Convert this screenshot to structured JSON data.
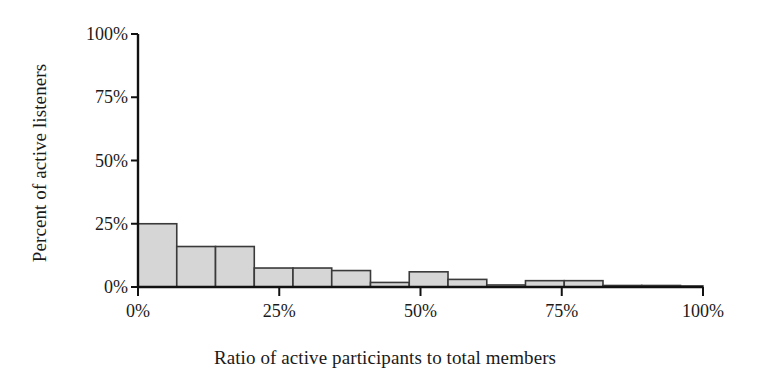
{
  "chart_data": {
    "type": "bar",
    "title": "",
    "subtitle": "",
    "xlabel": "Ratio of active participants to total members",
    "ylabel": "Percent of active listeners",
    "xlim": [
      0,
      100
    ],
    "ylim": [
      0,
      100
    ],
    "grid": false,
    "legend": null,
    "x_ticks": [
      {
        "value": 0,
        "label": "0%"
      },
      {
        "value": 25,
        "label": "25%"
      },
      {
        "value": 50,
        "label": "50%"
      },
      {
        "value": 75,
        "label": "75%"
      },
      {
        "value": 100,
        "label": "100%"
      }
    ],
    "y_ticks": [
      {
        "value": 0,
        "label": "0%"
      },
      {
        "value": 25,
        "label": "25%"
      },
      {
        "value": 50,
        "label": "50%"
      },
      {
        "value": 75,
        "label": "75%"
      },
      {
        "value": 100,
        "label": "100%"
      }
    ],
    "bin_width": 6.86,
    "bar_fill": "#d6d6d6",
    "bar_stroke": "#3a3a3a",
    "axis_color": "#111111",
    "categories": [
      "0-7%",
      "7-14%",
      "14-21%",
      "21-27%",
      "27-34%",
      "34-41%",
      "41-48%",
      "48-55%",
      "55-62%",
      "62-69%",
      "69-75%",
      "75-82%",
      "82-89%",
      "89-96%",
      "96-100%"
    ],
    "bin_starts": [
      0,
      6.86,
      13.72,
      20.58,
      27.43,
      34.29,
      41.15,
      48.01,
      54.87,
      61.73,
      68.58,
      75.44,
      82.3,
      89.16,
      96.02
    ],
    "values": [
      25,
      16,
      16,
      7.5,
      7.5,
      6.5,
      1.8,
      6.0,
      3.0,
      0.8,
      2.5,
      2.5,
      0.6,
      0.6,
      0.4
    ]
  }
}
